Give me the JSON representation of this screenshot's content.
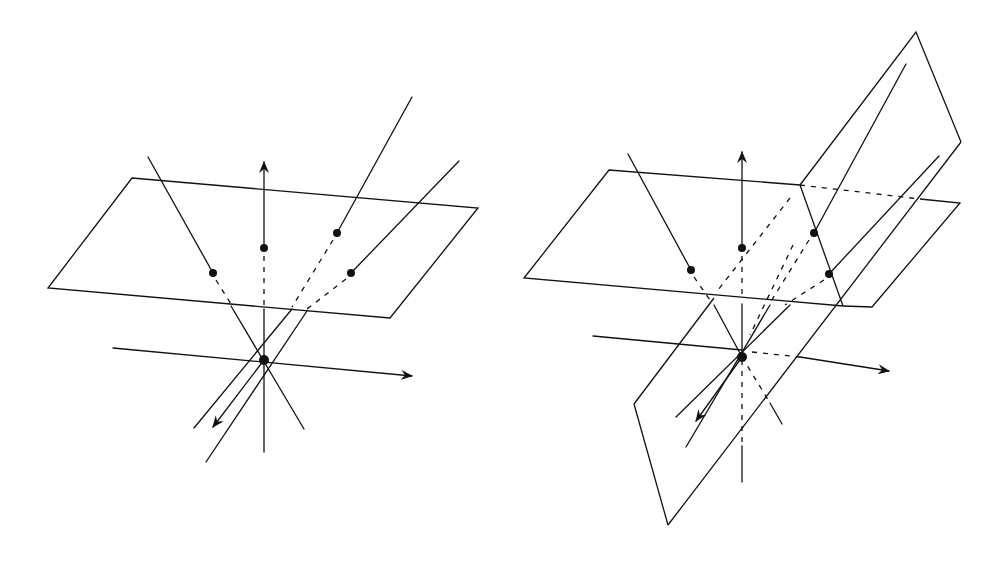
{
  "figure": {
    "panels": [
      {
        "id": "left",
        "description": "Single image plane with rays from a pinhole origin through image points",
        "plane": [
          [
            132,
            178
          ],
          [
            478,
            208
          ],
          [
            390,
            318
          ],
          [
            48,
            288
          ]
        ],
        "origin": [
          264,
          360
        ],
        "axes": {
          "vertical_up": {
            "from": [
              264,
              248
            ],
            "to": [
              264,
              162
            ]
          },
          "vertical_down": {
            "from": [
              264,
              360
            ],
            "to": [
              264,
              452
            ]
          },
          "horizontal": {
            "from": [
              113,
              348
            ],
            "to": [
              412,
              376
            ]
          },
          "depth": {
            "from": [
              264,
              360
            ],
            "to": [
              213,
              427
            ]
          }
        },
        "points": [
          [
            213,
            273
          ],
          [
            264,
            248
          ],
          [
            337,
            233
          ],
          [
            351,
            273
          ]
        ],
        "rays_solid": [
          [
            [
              213,
              273
            ],
            [
              148,
              157
            ]
          ],
          [
            [
              337,
              233
            ],
            [
              412,
              97
            ]
          ],
          [
            [
              351,
              273
            ],
            [
              459,
              161
            ]
          ]
        ],
        "rays_hidden": [
          [
            [
              213,
              273
            ],
            [
              230,
              300
            ]
          ],
          [
            [
              264,
              252
            ],
            [
              264,
              305
            ]
          ],
          [
            [
              337,
              233
            ],
            [
              292,
              305
            ]
          ],
          [
            [
              351,
              273
            ],
            [
              306,
              305
            ]
          ]
        ],
        "rays_below_plane": [
          [
            [
              230,
              305
            ],
            [
              304,
              429
            ]
          ],
          [
            [
              264,
              305
            ],
            [
              264,
              360
            ]
          ],
          [
            [
              292,
              305
            ],
            [
              194,
              428
            ]
          ],
          [
            [
              306,
              305
            ],
            [
              206,
              462
            ]
          ]
        ]
      },
      {
        "id": "right",
        "description": "Image plane intersected by a second tilted plane; rays through points on both planes",
        "plane_horizontal": [
          [
            609,
            170
          ],
          [
            960,
            203
          ],
          [
            872,
            307
          ],
          [
            524,
            278
          ]
        ],
        "plane_tilted": [
          [
            916,
            32
          ],
          [
            961,
            142
          ],
          [
            668,
            525
          ],
          [
            634,
            404
          ]
        ],
        "origin": [
          742,
          357
        ],
        "points": [
          [
            691,
            270
          ],
          [
            742,
            248
          ],
          [
            814,
            233
          ],
          [
            829,
            274
          ]
        ],
        "axes": {
          "vertical_up": {
            "from": [
              742,
              240
            ],
            "to": [
              742,
              152
            ]
          },
          "horizontal": {
            "from": [
              593,
              336
            ],
            "to": [
              889,
              371
            ]
          },
          "depth": {
            "from": [
              742,
              357
            ],
            "to": [
              696,
              421
            ]
          }
        }
      }
    ]
  }
}
